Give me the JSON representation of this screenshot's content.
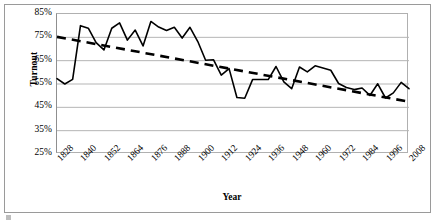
{
  "chart_data": {
    "type": "line",
    "title": "",
    "xlabel": "Year",
    "ylabel": "Turnout",
    "ylim": [
      25,
      85
    ],
    "ytick_labels": [
      "85%",
      "75%",
      "65%",
      "55%",
      "45%",
      "35%",
      "25%"
    ],
    "ytick_values": [
      85,
      75,
      65,
      55,
      45,
      35,
      25
    ],
    "xlim": [
      1828,
      2008
    ],
    "xtick_labels": [
      "1828",
      "1840",
      "1852",
      "1864",
      "1876",
      "1888",
      "1900",
      "1912",
      "1924",
      "1936",
      "1948",
      "1960",
      "1972",
      "1984",
      "1996",
      "2008"
    ],
    "xtick_values": [
      1828,
      1840,
      1852,
      1864,
      1876,
      1888,
      1900,
      1912,
      1924,
      1936,
      1948,
      1960,
      1972,
      1984,
      1996,
      2008
    ],
    "grid": true,
    "legend": false,
    "x": [
      1828,
      1832,
      1836,
      1840,
      1844,
      1848,
      1852,
      1856,
      1860,
      1864,
      1868,
      1872,
      1876,
      1880,
      1884,
      1888,
      1892,
      1896,
      1900,
      1904,
      1908,
      1912,
      1916,
      1920,
      1924,
      1928,
      1932,
      1936,
      1940,
      1944,
      1948,
      1952,
      1956,
      1960,
      1964,
      1968,
      1972,
      1976,
      1980,
      1984,
      1988,
      1992,
      1996,
      2000,
      2004,
      2008
    ],
    "series": [
      {
        "name": "Turnout",
        "style": "solid",
        "color": "#000000",
        "values": [
          57.3,
          55.0,
          57.0,
          80.0,
          78.9,
          72.7,
          69.6,
          78.9,
          81.2,
          73.8,
          78.1,
          71.3,
          81.8,
          79.4,
          77.9,
          79.3,
          74.7,
          79.3,
          73.2,
          65.2,
          65.4,
          58.8,
          61.6,
          49.2,
          48.9,
          56.9,
          56.9,
          56.9,
          62.5,
          55.9,
          53.0,
          62.3,
          60.2,
          62.8,
          61.9,
          60.9,
          55.2,
          53.5,
          52.6,
          53.3,
          50.1,
          55.1,
          49.0,
          51.2,
          55.7,
          53.0
        ]
      },
      {
        "name": "Linear trend",
        "style": "dashed",
        "color": "#000000",
        "values": [
          75.2,
          74.5,
          73.9,
          73.3,
          72.7,
          72.1,
          71.5,
          70.8,
          70.2,
          69.6,
          69.0,
          68.4,
          67.8,
          67.1,
          66.5,
          65.9,
          65.3,
          64.7,
          64.1,
          63.4,
          62.8,
          62.2,
          61.6,
          61.0,
          60.4,
          59.7,
          59.1,
          58.5,
          57.9,
          57.3,
          56.7,
          56.0,
          55.4,
          54.8,
          54.2,
          53.6,
          53.0,
          52.3,
          51.7,
          51.1,
          50.5,
          49.9,
          49.3,
          48.6,
          48.0,
          47.4
        ]
      }
    ]
  }
}
